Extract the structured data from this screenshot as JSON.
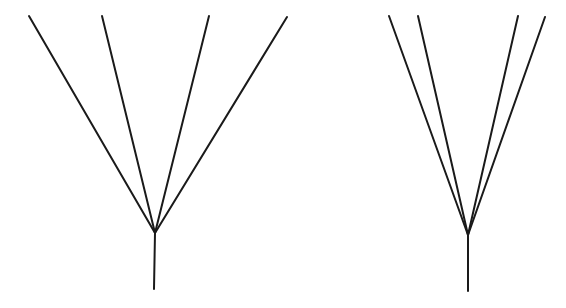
{
  "diagram": {
    "stroke_color": "#1a1a1a",
    "stroke_width": 2,
    "fans": [
      {
        "name": "left-fan",
        "vertex": [
          155,
          233
        ],
        "stem_end": [
          154,
          289
        ],
        "branches": [
          [
            29,
            16
          ],
          [
            102,
            16
          ],
          [
            209,
            16
          ],
          [
            287,
            17
          ]
        ]
      },
      {
        "name": "right-fan",
        "vertex": [
          468,
          235
        ],
        "stem_end": [
          468,
          291
        ],
        "branches": [
          [
            389,
            16
          ],
          [
            418,
            16
          ],
          [
            518,
            16
          ],
          [
            545,
            17
          ]
        ]
      }
    ]
  }
}
